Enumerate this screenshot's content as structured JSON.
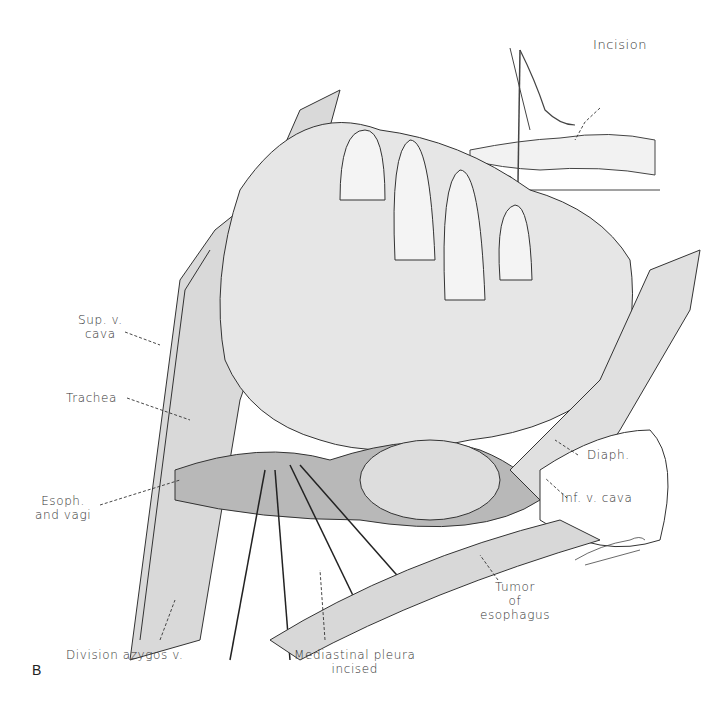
{
  "figure": {
    "panel_letter": "B"
  },
  "inset": {
    "label": "Incision"
  },
  "labels": {
    "sup_v_cava": [
      "Sup. v.",
      "cava"
    ],
    "trachea": "Trachea",
    "esoph_vagi": [
      "Esoph.",
      "and vagi"
    ],
    "division_azygos": "Division azygos v.",
    "mediastinal_pleura": [
      "Mediastinal pleura",
      "incised"
    ],
    "tumor": [
      "Tumor",
      "of",
      "esophagus"
    ],
    "diaph": "Diaph.",
    "inf_v_cava": "Inf. v. cava"
  },
  "colors": {
    "ink": "#2a2a2a",
    "background": "#ffffff"
  }
}
